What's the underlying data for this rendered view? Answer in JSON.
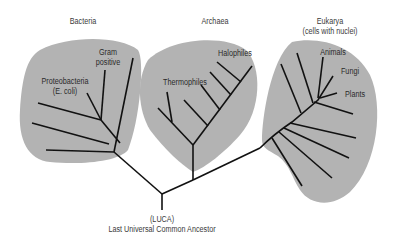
{
  "diagram": {
    "type": "phylogenetic-tree",
    "colors": {
      "blob": "#b3b3b3",
      "branch": "#111111",
      "text": "#333333",
      "background": "#ffffff"
    },
    "domains": [
      {
        "name": "Bacteria",
        "title": "Bacteria",
        "subtitle": "",
        "groups": [
          "Gram positive",
          "Proteobacteria (E. coli)"
        ]
      },
      {
        "name": "Archaea",
        "title": "Archaea",
        "subtitle": "",
        "groups": [
          "Thermophiles",
          "Halophiles"
        ]
      },
      {
        "name": "Eukarya",
        "title": "Eukarya",
        "subtitle": "(cells with nuclei)",
        "groups": [
          "Animals",
          "Fungi",
          "Plants"
        ]
      }
    ],
    "labels": {
      "bacteria": "Bacteria",
      "archaea": "Archaea",
      "eukarya": "Eukarya",
      "eukarya_sub": "(cells with nuclei)",
      "gram_line1": "Gram",
      "gram_line2": "positive",
      "proteo_line1": "Proteobacteria",
      "proteo_line2": "(E. coli)",
      "thermophiles": "Thermophiles",
      "halophiles": "Halophiles",
      "animals": "Animals",
      "fungi": "Fungi",
      "plants": "Plants",
      "luca_abbr": "(LUCA)",
      "luca_full": "Last Universal Common Ancestor"
    }
  }
}
